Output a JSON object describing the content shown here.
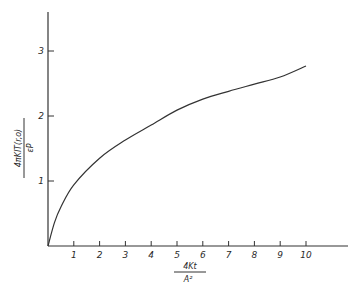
{
  "chart_data": {
    "type": "line",
    "title": "",
    "xlabel": {
      "numerator": "4Kt",
      "denominator": "A²"
    },
    "ylabel": {
      "numerator": "4πKlT(r,o)",
      "denominator": "εP"
    },
    "xlim": [
      0,
      10.5
    ],
    "ylim": [
      0,
      3.6
    ],
    "x_ticks": [
      "1",
      "2",
      "3",
      "4",
      "5",
      "6",
      "7",
      "8",
      "9",
      "10"
    ],
    "y_ticks": [
      "1",
      "2",
      "3"
    ],
    "grid": false,
    "legend": null,
    "series": [
      {
        "name": "T(r,o)",
        "x": [
          0,
          0.25,
          0.5,
          1,
          2,
          3,
          4,
          5,
          6,
          7,
          8,
          9,
          10
        ],
        "y": [
          0,
          0.36,
          0.6,
          0.94,
          1.35,
          1.63,
          1.86,
          2.09,
          2.26,
          2.38,
          2.49,
          2.6,
          2.77
        ]
      }
    ]
  }
}
